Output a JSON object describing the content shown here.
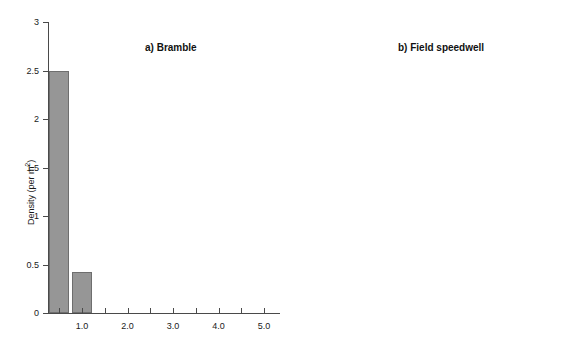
{
  "figure": {
    "background_color": "#ffffff",
    "bar_fill_color": "#969696",
    "bar_edge_color": "#6e6e6e",
    "axis_color": "#4a4a4a"
  },
  "y_axis_title": {
    "text_main": "Density (per m",
    "text_sup": "2",
    "text_close": ")"
  },
  "chart_data": [
    {
      "type": "bar",
      "title": "a) Bramble",
      "xlabel": "",
      "ylabel": "Density (per m2)",
      "x": [
        0.5,
        1.0,
        1.5,
        2.0,
        2.5,
        3.0,
        3.5,
        4.0,
        4.5,
        5.0
      ],
      "values": [
        2.5,
        0.42,
        0,
        0,
        0,
        0,
        0,
        0,
        0,
        0
      ],
      "ylim": [
        0,
        3
      ],
      "yticks": [
        0,
        0.5,
        1,
        1.5,
        2,
        2.5,
        3
      ],
      "ytick_labels": [
        "0",
        "0.5",
        "1",
        "1.5",
        "2",
        "2.5",
        "3"
      ],
      "xlim": [
        0.25,
        5.35
      ],
      "xticks": [
        0.5,
        1.0,
        1.5,
        2.0,
        2.5,
        3.0,
        3.5,
        4.0,
        4.5,
        5.0
      ],
      "xtick_labels": [
        "",
        "1.0",
        "",
        "2.0",
        "",
        "3.0",
        "",
        "4.0",
        "",
        "5.0"
      ],
      "grid": false,
      "legend": "none"
    },
    {
      "type": "bar",
      "title": "b) Field speedwell",
      "xlabel": "",
      "ylabel": "",
      "x": [
        0.5,
        1.0,
        1.5,
        2.0,
        2.5,
        3.0,
        3.5,
        4.0,
        4.5,
        5.0
      ],
      "values": [
        3.6,
        4.0,
        13.7,
        21.3,
        27.4,
        21.9,
        30.1,
        23.6,
        19.4,
        22.0
      ],
      "ylim": [
        0,
        35
      ],
      "yticks": [
        0,
        5,
        10,
        15,
        20,
        25,
        30,
        35
      ],
      "ytick_labels": [
        "0",
        "5",
        "10",
        "15",
        "20",
        "25",
        "30",
        "35"
      ],
      "xlim": [
        0.25,
        5.35
      ],
      "xticks": [
        0.5,
        1.0,
        1.5,
        2.0,
        2.5,
        3.0,
        3.5,
        4.0,
        4.5,
        5.0
      ],
      "xtick_labels": [
        "",
        "1.0",
        "",
        "2.0",
        "",
        "3.0",
        "",
        "4.0",
        "",
        "5.0"
      ],
      "grid": false,
      "legend": "none"
    }
  ]
}
